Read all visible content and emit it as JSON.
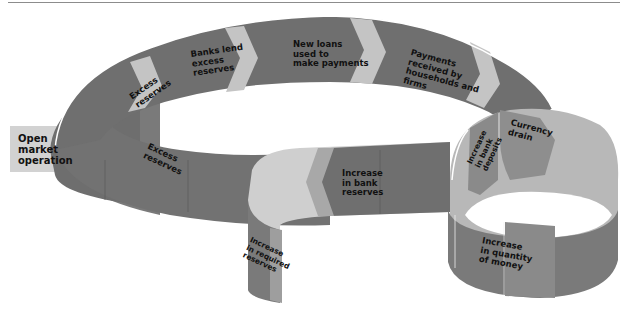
{
  "diagram": {
    "type": "flow-loop",
    "title": "",
    "colors": {
      "ribbon_dark": "#6e6e6e",
      "ribbon_mid": "#858585",
      "ribbon_light": "#b0b0b0",
      "ribbon_pale": "#cfcfcf",
      "chevron": "#bdbdbd",
      "text": "#111111"
    },
    "nodes": [
      {
        "id": "open-market-operation",
        "label": "Open\nmarket\noperation"
      },
      {
        "id": "excess-reserves-top",
        "label": "Excess\nreserves"
      },
      {
        "id": "banks-lend",
        "label": "Banks lend\nexcess\nreserves"
      },
      {
        "id": "new-loans",
        "label": "New loans\nused to\nmake payments"
      },
      {
        "id": "payments-received",
        "label": "Payments\nreceived by\nhouseholds and\nfirms"
      },
      {
        "id": "increase-bank-deposits",
        "label": "Increase\nin bank\ndeposits"
      },
      {
        "id": "currency-drain",
        "label": "Currency\ndrain"
      },
      {
        "id": "increase-quantity-money",
        "label": "Increase\nin quantity\nof money"
      },
      {
        "id": "increase-bank-reserves",
        "label": "Increase\nin bank\nreserves"
      },
      {
        "id": "increase-required-reserves",
        "label": "Increase\nin required\nreserves"
      },
      {
        "id": "excess-reserves-inner",
        "label": "Excess\nreserves"
      }
    ],
    "labels": {
      "open_market": [
        "Open",
        "market",
        "operation"
      ],
      "excess_top": [
        "Excess",
        "reserves"
      ],
      "banks_lend": [
        "Banks lend",
        "excess",
        "reserves"
      ],
      "new_loans": [
        "New loans",
        "used to",
        "make payments"
      ],
      "payments": [
        "Payments",
        "received by",
        "households and",
        "firms"
      ],
      "deposits": [
        "Increase",
        "in bank",
        "deposits"
      ],
      "currency": [
        "Currency",
        "drain"
      ],
      "quantity": [
        "Increase",
        "in quantity",
        "of money"
      ],
      "bank_reserves": [
        "Increase",
        "in bank",
        "reserves"
      ],
      "required": [
        "Increase",
        "in required",
        "reserves"
      ],
      "excess_inner": [
        "Excess",
        "reserves"
      ]
    }
  }
}
